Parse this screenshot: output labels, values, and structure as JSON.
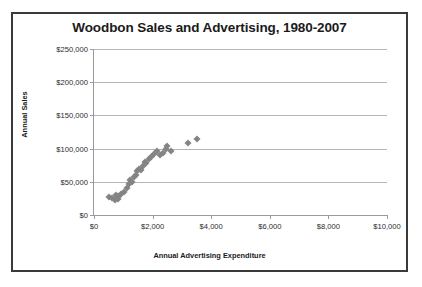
{
  "chart_data": {
    "type": "scatter",
    "title": "Woodbon Sales and Advertising, 1980-2007",
    "xlabel": "Annual Advertising Expenditure",
    "ylabel": "Annual Sales",
    "xlim": [
      0,
      10000
    ],
    "ylim": [
      0,
      250000
    ],
    "grid": true,
    "legend": "none",
    "marker_color": "#848484",
    "marker_shape": "diamond",
    "x_ticks": [
      0,
      2000,
      4000,
      6000,
      8000,
      10000
    ],
    "x_tick_labels": [
      "$0",
      "$2,000",
      "$4,000",
      "$6,000",
      "$8,000",
      "$10,000"
    ],
    "y_ticks": [
      0,
      50000,
      100000,
      150000,
      200000,
      250000
    ],
    "y_tick_labels": [
      "$0",
      "$50,000",
      "$100,000",
      "$150,000",
      "$200,000",
      "$250,000"
    ],
    "series": [
      {
        "name": "Annual Sales vs Advertising",
        "points": [
          {
            "x": 520,
            "y": 27000
          },
          {
            "x": 620,
            "y": 25000
          },
          {
            "x": 700,
            "y": 22000
          },
          {
            "x": 760,
            "y": 30000
          },
          {
            "x": 810,
            "y": 24000
          },
          {
            "x": 870,
            "y": 28000
          },
          {
            "x": 930,
            "y": 32000
          },
          {
            "x": 1020,
            "y": 35000
          },
          {
            "x": 1120,
            "y": 40000
          },
          {
            "x": 1180,
            "y": 47000
          },
          {
            "x": 1240,
            "y": 52000
          },
          {
            "x": 1300,
            "y": 50000
          },
          {
            "x": 1360,
            "y": 57000
          },
          {
            "x": 1420,
            "y": 60000
          },
          {
            "x": 1470,
            "y": 66000
          },
          {
            "x": 1530,
            "y": 70000
          },
          {
            "x": 1590,
            "y": 68000
          },
          {
            "x": 1660,
            "y": 74000
          },
          {
            "x": 1730,
            "y": 80000
          },
          {
            "x": 1790,
            "y": 78000
          },
          {
            "x": 1880,
            "y": 84000
          },
          {
            "x": 1960,
            "y": 88000
          },
          {
            "x": 2060,
            "y": 92000
          },
          {
            "x": 2150,
            "y": 97000
          },
          {
            "x": 2260,
            "y": 90000
          },
          {
            "x": 2360,
            "y": 94000
          },
          {
            "x": 2450,
            "y": 100000
          },
          {
            "x": 2500,
            "y": 104000
          },
          {
            "x": 2620,
            "y": 96000
          },
          {
            "x": 3200,
            "y": 108000
          },
          {
            "x": 3500,
            "y": 115000
          }
        ]
      }
    ]
  }
}
